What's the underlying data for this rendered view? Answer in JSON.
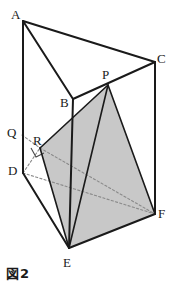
{
  "figure": {
    "caption": "図2",
    "shape_name": "triangular-prism",
    "fill_color": "#c8c8c8",
    "line_color": "#1a1a1a",
    "dotted_color": "#8a8a8a",
    "background": "#ffffff",
    "vertices": [
      {
        "id": "A",
        "label": "A",
        "x": 23,
        "y": 21,
        "lx": 11,
        "ly": 8
      },
      {
        "id": "B",
        "label": "B",
        "x": 73,
        "y": 99,
        "lx": 60,
        "ly": 96
      },
      {
        "id": "C",
        "label": "C",
        "x": 155,
        "y": 62,
        "lx": 157,
        "ly": 52
      },
      {
        "id": "D",
        "label": "D",
        "x": 23,
        "y": 173,
        "lx": 8,
        "ly": 164
      },
      {
        "id": "E",
        "label": "E",
        "x": 69,
        "y": 248,
        "lx": 63,
        "ly": 256
      },
      {
        "id": "F",
        "label": "F",
        "x": 155,
        "y": 214,
        "lx": 158,
        "ly": 207
      },
      {
        "id": "P",
        "label": "P",
        "x": 108,
        "y": 85,
        "lx": 102,
        "ly": 68
      },
      {
        "id": "Q",
        "label": "Q",
        "x": 22,
        "y": 135,
        "lx": 7,
        "ly": 126
      },
      {
        "id": "R",
        "label": "R",
        "x": 40,
        "y": 148,
        "lx": 33,
        "ly": 134
      }
    ],
    "solid_edges": [
      {
        "name": "edge-A-B",
        "from": "A",
        "to": "B"
      },
      {
        "name": "edge-A-C",
        "from": "A",
        "to": "C"
      },
      {
        "name": "edge-B-C",
        "from": "B",
        "to": "C"
      },
      {
        "name": "edge-A-D",
        "from": "A",
        "to": "D"
      },
      {
        "name": "edge-B-E",
        "from": "B",
        "to": "E"
      },
      {
        "name": "edge-C-F",
        "from": "C",
        "to": "F"
      },
      {
        "name": "edge-D-E",
        "from": "D",
        "to": "E"
      },
      {
        "name": "edge-E-F",
        "from": "E",
        "to": "F"
      }
    ],
    "dotted_edges": [
      {
        "name": "edge-D-F",
        "from": "D",
        "to": "F"
      },
      {
        "name": "edge-D-R",
        "from": "D",
        "to": "R"
      },
      {
        "name": "edge-Q-R",
        "from": "Q",
        "to": "R"
      },
      {
        "name": "edge-R-F",
        "from": "R",
        "to": "F"
      }
    ],
    "shaded_faces": [
      {
        "name": "face-R-P-F-E",
        "points": "40,148 108,85 155,214 69,248"
      }
    ],
    "shaded_outline_edges": [
      {
        "name": "edge-P-E",
        "from": "P",
        "to": "E"
      },
      {
        "name": "edge-P-F",
        "from": "P",
        "to": "F"
      },
      {
        "name": "edge-R-P",
        "from": "R",
        "to": "P"
      },
      {
        "name": "edge-R-E",
        "from": "R",
        "to": "E"
      }
    ],
    "right_angle_mark": {
      "name": "right-angle-mark-at-R",
      "points": "31,148 36,157 44,153"
    }
  }
}
